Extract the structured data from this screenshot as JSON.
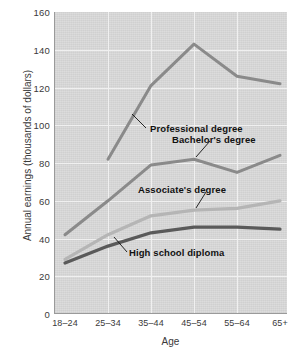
{
  "chart_data": {
    "type": "line",
    "title": "",
    "xlabel": "Age",
    "ylabel": "Annual earnings (thousands of dollars)",
    "categories": [
      "18–24",
      "25–34",
      "35–44",
      "45–54",
      "55–64",
      "65+"
    ],
    "ylim": [
      0,
      160
    ],
    "yticks": [
      0,
      20,
      40,
      60,
      80,
      100,
      120,
      140,
      160
    ],
    "grid": true,
    "legend_position": "inline-annotations",
    "series": [
      {
        "name": "Professional degree",
        "color": "#8a8a8a",
        "values": [
          null,
          82,
          121,
          143,
          126,
          122
        ],
        "annotation": "Professional degree"
      },
      {
        "name": "Bachelor's degree",
        "color": "#8a8a8a",
        "values": [
          42,
          60,
          79,
          82,
          75,
          84
        ],
        "annotation": "Bachelor's degree"
      },
      {
        "name": "Associate's degree",
        "color": "#b5b5b5",
        "values": [
          29,
          42,
          52,
          55,
          56,
          60
        ],
        "annotation": "Associate's degree"
      },
      {
        "name": "High school diploma",
        "color": "#5a5a5a",
        "values": [
          27,
          36,
          43,
          46,
          46,
          45
        ],
        "annotation": "High school diploma"
      }
    ]
  },
  "axis": {
    "y_ticks": [
      "160",
      "140",
      "120",
      "100",
      "80",
      "60",
      "40",
      "20",
      "0"
    ],
    "x_ticks": [
      "18–24",
      "25–34",
      "35–44",
      "45–54",
      "55–64",
      "65+"
    ],
    "x_title": "Age",
    "y_title": "Annual earnings (thousands of dollars)"
  },
  "annotations": {
    "professional": "Professional degree",
    "bachelors": "Bachelor's degree",
    "associates": "Associate's degree",
    "highschool": "High school diploma"
  },
  "colors": {
    "plot_background": "#d9d9d9",
    "page_background": "#ffffff",
    "gridline": "#f0f0f0",
    "axis": "#9a9a9a",
    "professional_line": "#8a8a8a",
    "bachelors_line": "#8a8a8a",
    "associates_line": "#b5b5b5",
    "highschool_line": "#5a5a5a",
    "text": "#3a3a3a"
  }
}
